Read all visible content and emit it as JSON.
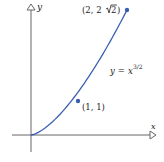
{
  "chart_data": {
    "type": "line",
    "title": "",
    "xlabel": "x",
    "ylabel": "y",
    "equation_label": "y = x^{3/2}",
    "series": [
      {
        "name": "y = x^(3/2)",
        "x": [
          0,
          0.25,
          0.5,
          0.75,
          1,
          1.25,
          1.5,
          1.75,
          2
        ],
        "values": [
          0,
          0.125,
          0.354,
          0.65,
          1,
          1.398,
          1.837,
          2.315,
          2.828
        ]
      }
    ],
    "points": [
      {
        "x": 1,
        "y": 1,
        "label": "(1, 1)"
      },
      {
        "x": 2,
        "y": 2.828,
        "label": "(2, 2√2)"
      }
    ],
    "xlim": [
      -0.4,
      2.6
    ],
    "ylim": [
      -0.4,
      2.95
    ],
    "grid": false,
    "colors": {
      "curve": "#3a5fb0",
      "axis": "#555555"
    }
  },
  "labels": {
    "x_axis": "x",
    "y_axis": "y",
    "eq_y": "y",
    "eq_equals": " = ",
    "eq_x": "x",
    "eq_exp": "3/2",
    "point1": "(1, 1)",
    "point2_prefix": "(2, 2",
    "point2_radical": "2",
    "point2_suffix": ")"
  }
}
